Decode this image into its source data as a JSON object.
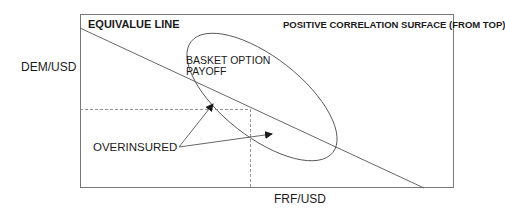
{
  "diagram": {
    "title_left": "EQUIVALUE LINE",
    "title_right": "POSITIVE CORRELATION SURFACE (FROM TOP)",
    "y_axis_label": "DEM/USD",
    "x_axis_label": "FRF/USD",
    "payoff_label_line1": "BASKET OPTION",
    "payoff_label_line2": "PAYOFF",
    "annotation_label": "OVERINSURED",
    "colors": {
      "line": "#555555",
      "frame": "#777777",
      "dashed": "#888888",
      "text": "#1a1a1a"
    },
    "elements": {
      "frame": {
        "x": 80,
        "y": 14,
        "width": 374,
        "height": 174
      },
      "equivalue_line": {
        "x1": 80,
        "y1": 28,
        "x2": 424,
        "y2": 188
      },
      "ellipse": {
        "cx": 262,
        "cy": 97,
        "rx": 90,
        "ry": 40,
        "rotation_deg": 38
      },
      "dashed_horizontal": {
        "x1": 80,
        "y1": 109,
        "x2": 250,
        "y2": 109
      },
      "dashed_vertical": {
        "x1": 250,
        "y1": 109,
        "x2": 250,
        "y2": 188
      },
      "arrows": [
        {
          "from": [
            179,
            147
          ],
          "to": [
            213,
            104
          ]
        },
        {
          "from": [
            179,
            147
          ],
          "to": [
            272,
            134
          ]
        }
      ]
    }
  }
}
